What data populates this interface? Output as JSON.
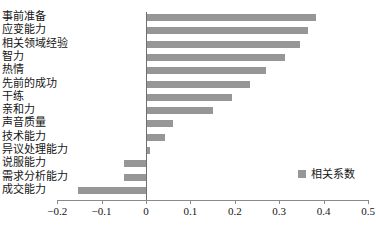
{
  "chart_data": {
    "type": "bar",
    "orientation": "horizontal",
    "title": "",
    "xlabel": "",
    "ylabel": "",
    "xlim": [
      -0.2,
      0.5
    ],
    "xticks": [
      -0.2,
      -0.1,
      0,
      0.1,
      0.2,
      0.3,
      0.4,
      0.5
    ],
    "xtick_labels": [
      "−0.2",
      "−0.1",
      "0",
      "0.1",
      "0.2",
      "0.3",
      "0.4",
      "0.5"
    ],
    "grid": false,
    "legend_position": "bottom-right",
    "categories": [
      "事前准备",
      "应变能力",
      "相关领域经验",
      "智力",
      "热情",
      "先前的成功",
      "干练",
      "亲和力",
      "声音质量",
      "技术能力",
      "异议处理能力",
      "说服能力",
      "需求分析能力",
      "成交能力"
    ],
    "series": [
      {
        "name": "相关系数",
        "color": "#969696",
        "values": [
          0.383,
          0.365,
          0.347,
          0.313,
          0.27,
          0.234,
          0.193,
          0.151,
          0.061,
          0.043,
          0.008,
          -0.05,
          -0.05,
          -0.153
        ]
      }
    ]
  },
  "legend": {
    "label": "相关系数",
    "swatch_color": "#969696"
  },
  "axis": {
    "line_color": "#8a8a8a",
    "zero_line_color": "#6f6f6f"
  }
}
